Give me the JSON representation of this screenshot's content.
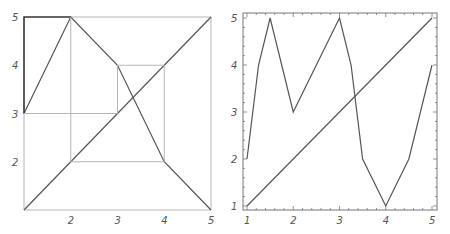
{
  "chart_data": [
    {
      "type": "line",
      "title": "",
      "description": "Cobweb diagram of map f with identity line",
      "xlabel": "",
      "ylabel": "",
      "xlim": [
        1,
        5
      ],
      "ylim": [
        1,
        5
      ],
      "x_ticks": [
        "2",
        "3",
        "4",
        "5"
      ],
      "y_ticks": [
        "2",
        "3",
        "4",
        "5"
      ],
      "grid": false,
      "series": [
        {
          "name": "f(x)",
          "x": [
            1,
            2,
            3,
            4,
            5
          ],
          "y": [
            3,
            5,
            4,
            2,
            1
          ]
        },
        {
          "name": "y = x",
          "x": [
            1,
            5
          ],
          "y": [
            1,
            5
          ]
        },
        {
          "name": "cobweb-start",
          "x": [
            1,
            1,
            2
          ],
          "y": [
            3,
            5,
            5
          ]
        },
        {
          "name": "cobweb",
          "x": [
            2,
            2,
            4,
            4,
            3,
            3,
            1
          ],
          "y": [
            5,
            2,
            2,
            4,
            4,
            3,
            3
          ]
        }
      ]
    },
    {
      "type": "line",
      "title": "",
      "xlabel": "",
      "ylabel": "",
      "xlim": [
        1,
        5
      ],
      "ylim": [
        1,
        5
      ],
      "x_ticks": [
        "1",
        "2",
        "3",
        "4",
        "5"
      ],
      "y_ticks": [
        "1",
        "2",
        "3",
        "4",
        "5"
      ],
      "grid": false,
      "frame": true,
      "series": [
        {
          "name": "path",
          "x": [
            1,
            1.25,
            1.5,
            2,
            3,
            3.25,
            3.5,
            4,
            4.5,
            5
          ],
          "y": [
            2,
            4,
            5,
            3,
            5,
            4,
            2,
            1,
            2,
            4
          ]
        },
        {
          "name": "y = x",
          "x": [
            1,
            5
          ],
          "y": [
            1,
            5
          ]
        }
      ]
    }
  ],
  "colors": {
    "curve": "#555555",
    "cobweb": "#b5b5b5",
    "frame": "#777777",
    "tick_label": "#555555"
  }
}
